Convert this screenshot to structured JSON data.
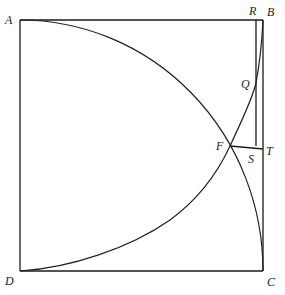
{
  "figure": {
    "type": "geometric-construction",
    "points": {
      "A": {
        "label": "A",
        "x": 20,
        "y": 20
      },
      "B": {
        "label": "B",
        "x": 263,
        "y": 20
      },
      "C": {
        "label": "C",
        "x": 263,
        "y": 271
      },
      "D": {
        "label": "D",
        "x": 20,
        "y": 271
      },
      "R": {
        "label": "R",
        "x": 256,
        "y": 20
      },
      "Q": {
        "label": "Q",
        "x": 256,
        "y": 83
      },
      "F": {
        "label": "F",
        "x": 230,
        "y": 146
      },
      "S": {
        "label": "S",
        "x": 256,
        "y": 146
      },
      "T": {
        "label": "T",
        "x": 263,
        "y": 149
      }
    },
    "segments": [
      {
        "from": "A",
        "to": "B"
      },
      {
        "from": "B",
        "to": "C"
      },
      {
        "from": "C",
        "to": "D"
      },
      {
        "from": "D",
        "to": "A"
      },
      {
        "from": "R",
        "to": "S"
      },
      {
        "from": "F",
        "to": "T"
      }
    ],
    "curves": [
      {
        "name": "arc-A-to-C",
        "through": [
          "A",
          "F",
          "C"
        ],
        "center": "D"
      },
      {
        "name": "curve-D-to-B",
        "through": [
          "D",
          "F",
          "Q",
          "B"
        ]
      }
    ],
    "line_color": "#1a1a1a",
    "background": "#ffffff"
  },
  "labels": {
    "A": "A",
    "B": "B",
    "C": "C",
    "D": "D",
    "R": "R",
    "Q": "Q",
    "F": "F",
    "S": "S",
    "T": "T"
  }
}
